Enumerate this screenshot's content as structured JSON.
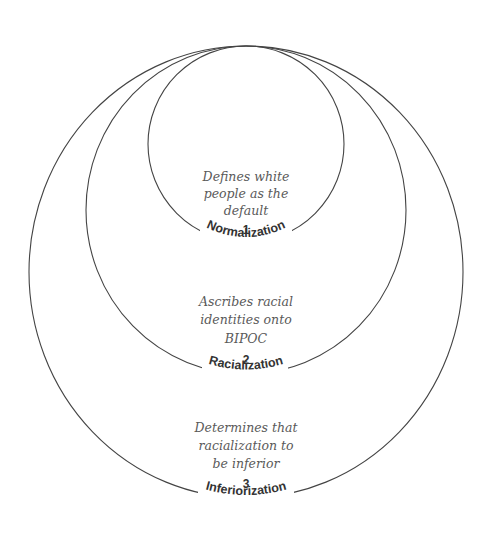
{
  "diagram": {
    "type": "nested-tangent-circles",
    "stroke_color": "#444444",
    "levels": [
      {
        "number": "1",
        "label": "Normalization",
        "description_lines": [
          "Defines white",
          "people as the",
          "default"
        ]
      },
      {
        "number": "2",
        "label": "Racialization",
        "description_lines": [
          "Ascribes racial",
          "identities onto",
          "BIPOC"
        ]
      },
      {
        "number": "3",
        "label": "Inferiorization",
        "description_lines": [
          "Determines that",
          "racialization to",
          "be inferior"
        ]
      }
    ]
  }
}
